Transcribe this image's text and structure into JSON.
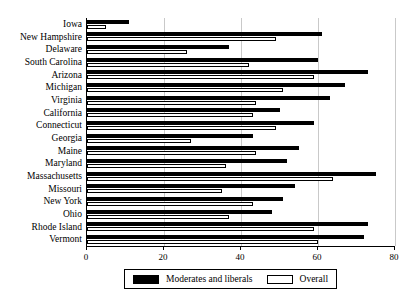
{
  "chart_data": {
    "type": "bar",
    "orientation": "horizontal",
    "title": "",
    "subtitle": "",
    "xlabel": "",
    "ylabel": "",
    "xlim": [
      0,
      80
    ],
    "xticks": [
      0,
      20,
      40,
      60,
      80
    ],
    "xtick_labels": [
      "0",
      "20",
      "40",
      "60",
      "80"
    ],
    "grid": true,
    "grid_axis": "x",
    "legend_position": "bottom",
    "categories": [
      "Iowa",
      "New Hampshire",
      "Delaware",
      "South Carolina",
      "Arizona",
      "Michigan",
      "Virginia",
      "California",
      "Connecticut",
      "Georgia",
      "Maine",
      "Maryland",
      "Massachusetts",
      "Missouri",
      "New York",
      "Ohio",
      "Rhode Island",
      "Vermont"
    ],
    "series": [
      {
        "name": "Moderates and liberals",
        "color": "#000000",
        "values": [
          11,
          61,
          37,
          60,
          73,
          67,
          63,
          50,
          59,
          43,
          55,
          52,
          75,
          54,
          51,
          48,
          73,
          72
        ]
      },
      {
        "name": "Overall",
        "color": "#ffffff",
        "values": [
          5,
          49,
          26,
          42,
          59,
          51,
          44,
          43,
          49,
          27,
          44,
          36,
          64,
          35,
          43,
          37,
          59,
          60
        ]
      }
    ]
  },
  "legend": {
    "items": [
      {
        "label": "Moderates and liberals",
        "swatch": "dark"
      },
      {
        "label": "Overall",
        "swatch": "light"
      }
    ]
  }
}
